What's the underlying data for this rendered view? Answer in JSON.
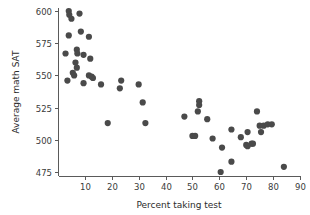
{
  "chart_data": {
    "type": "scatter",
    "title": "",
    "xlabel": "Percent taking test",
    "ylabel": "Average math SAT",
    "xlim": [
      0,
      90
    ],
    "ylim": [
      468,
      605
    ],
    "grid": false,
    "legend": null,
    "xticks": [
      10,
      20,
      30,
      40,
      50,
      60,
      70,
      80,
      90
    ],
    "yticks": [
      475,
      500,
      525,
      550,
      575,
      600
    ],
    "xtick_labels": [
      "10",
      "20",
      "30",
      "40",
      "50",
      "60",
      "70",
      "80",
      "90"
    ],
    "ytick_labels": [
      "475",
      "500",
      "525",
      "550",
      "575",
      "600"
    ],
    "marker": "filled-circle",
    "marker_color": "#4a4a4a",
    "marker_size": 3.1,
    "n_points": 51,
    "points": [
      {
        "x": 4.0,
        "y": 600
      },
      {
        "x": 4.2,
        "y": 597
      },
      {
        "x": 5.0,
        "y": 594
      },
      {
        "x": 8.0,
        "y": 598
      },
      {
        "x": 4.0,
        "y": 581
      },
      {
        "x": 8.5,
        "y": 584
      },
      {
        "x": 11.5,
        "y": 580
      },
      {
        "x": 2.8,
        "y": 567
      },
      {
        "x": 7.0,
        "y": 570
      },
      {
        "x": 7.2,
        "y": 567
      },
      {
        "x": 9.5,
        "y": 566
      },
      {
        "x": 12.0,
        "y": 563
      },
      {
        "x": 6.5,
        "y": 560
      },
      {
        "x": 7.0,
        "y": 556
      },
      {
        "x": 5.5,
        "y": 552
      },
      {
        "x": 6.0,
        "y": 550
      },
      {
        "x": 11.5,
        "y": 550
      },
      {
        "x": 12.5,
        "y": 549
      },
      {
        "x": 13.0,
        "y": 548
      },
      {
        "x": 3.5,
        "y": 546
      },
      {
        "x": 9.5,
        "y": 544
      },
      {
        "x": 16.0,
        "y": 543
      },
      {
        "x": 23.5,
        "y": 546
      },
      {
        "x": 23.0,
        "y": 540
      },
      {
        "x": 30.0,
        "y": 543
      },
      {
        "x": 31.5,
        "y": 529
      },
      {
        "x": 18.5,
        "y": 513
      },
      {
        "x": 32.5,
        "y": 513
      },
      {
        "x": 52.5,
        "y": 530
      },
      {
        "x": 52.5,
        "y": 527
      },
      {
        "x": 52.0,
        "y": 522
      },
      {
        "x": 47.0,
        "y": 518
      },
      {
        "x": 55.5,
        "y": 516
      },
      {
        "x": 74.0,
        "y": 522
      },
      {
        "x": 50.0,
        "y": 503
      },
      {
        "x": 51.0,
        "y": 503
      },
      {
        "x": 57.5,
        "y": 501
      },
      {
        "x": 64.5,
        "y": 508
      },
      {
        "x": 70.5,
        "y": 506
      },
      {
        "x": 75.0,
        "y": 511
      },
      {
        "x": 76.5,
        "y": 511
      },
      {
        "x": 78.0,
        "y": 512
      },
      {
        "x": 79.5,
        "y": 512
      },
      {
        "x": 75.5,
        "y": 506
      },
      {
        "x": 68.0,
        "y": 502
      },
      {
        "x": 70.0,
        "y": 496
      },
      {
        "x": 70.5,
        "y": 495
      },
      {
        "x": 72.0,
        "y": 497
      },
      {
        "x": 72.5,
        "y": 497
      },
      {
        "x": 61.0,
        "y": 494
      },
      {
        "x": 64.5,
        "y": 483
      },
      {
        "x": 60.5,
        "y": 475
      },
      {
        "x": 84.0,
        "y": 479
      }
    ]
  },
  "geometry": {
    "plot_left": 58,
    "plot_right": 300,
    "plot_top": 8,
    "plot_bottom": 176,
    "y_axis_top_value": 600,
    "y_axis_top_px": 11,
    "y_axis_bottom_value": 475,
    "y_axis_bottom_px": 172,
    "x_axis_left_value": 0,
    "x_axis_left_px": 58,
    "x_axis_right_value": 90,
    "x_axis_right_px": 300
  }
}
